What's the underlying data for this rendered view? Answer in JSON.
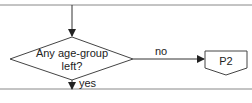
{
  "diagram": {
    "decision": {
      "line1": "Any age-group",
      "line2": "left?"
    },
    "no_label": "no",
    "yes_label": "yes",
    "offpage_connector": "P2",
    "colors": {
      "stroke": "#3a3a3a",
      "border": "#888888",
      "background": "#ffffff"
    }
  }
}
